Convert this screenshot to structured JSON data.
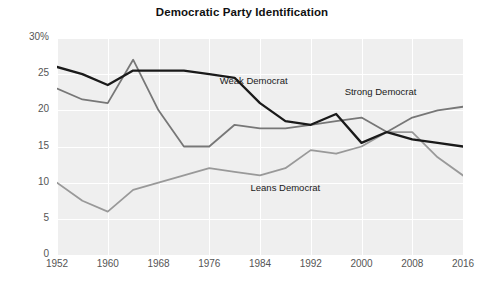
{
  "chart_data": {
    "type": "line",
    "title": "Democratic Party Identification",
    "xlabel": "",
    "ylabel": "",
    "ylim": [
      0,
      30
    ],
    "xlim": [
      1952,
      2016
    ],
    "grid": true,
    "legend_position": "inline-annotations",
    "y_ticks": [
      "0",
      "5",
      "10",
      "15",
      "20",
      "25",
      "30%"
    ],
    "y_tick_values": [
      0,
      5,
      10,
      15,
      20,
      25,
      30
    ],
    "x_ticks": [
      "1952",
      "1960",
      "1968",
      "1976",
      "1984",
      "1992",
      "2000",
      "2008",
      "2016"
    ],
    "x_tick_values": [
      1952,
      1960,
      1968,
      1976,
      1984,
      1992,
      2000,
      2008,
      2016
    ],
    "x": [
      1952,
      1956,
      1960,
      1964,
      1968,
      1972,
      1976,
      1980,
      1984,
      1988,
      1992,
      1996,
      2000,
      2004,
      2008,
      2012,
      2016
    ],
    "series": [
      {
        "name": "Weak Democrat",
        "color": "#1a1a1a",
        "values": [
          26.0,
          25.0,
          23.5,
          25.5,
          25.5,
          25.5,
          25.0,
          24.5,
          21.0,
          18.5,
          18.0,
          19.5,
          15.5,
          17.0,
          16.0,
          15.5,
          15.0
        ],
        "annotation": "Weak Democrat",
        "annotation_x": 1983,
        "annotation_y": 24.0
      },
      {
        "name": "Strong Democrat",
        "color": "#777777",
        "values": [
          23.0,
          21.5,
          21.0,
          27.0,
          20.0,
          15.0,
          15.0,
          18.0,
          17.5,
          17.5,
          18.0,
          18.5,
          19.0,
          17.0,
          19.0,
          20.0,
          20.5
        ],
        "annotation": "Strong Democrat",
        "annotation_x": 2003,
        "annotation_y": 22.5
      },
      {
        "name": "Leans Democrat",
        "color": "#999999",
        "values": [
          10.0,
          7.5,
          6.0,
          9.0,
          10.0,
          11.0,
          12.0,
          11.5,
          11.0,
          12.0,
          14.5,
          14.0,
          15.0,
          17.0,
          17.0,
          13.5,
          11.0
        ],
        "annotation": "Leans Democrat",
        "annotation_x": 1988,
        "annotation_y": 9.2
      }
    ]
  },
  "colors": {
    "plot_background": "#efefef",
    "page_background": "#ffffff",
    "gridline": "#ffffff",
    "tick_text": "#555555",
    "title_text": "#111111"
  }
}
